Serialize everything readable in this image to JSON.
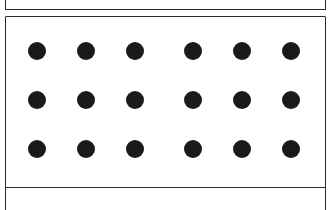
{
  "panels": [
    "top",
    "middle",
    "bottom"
  ],
  "dot_grid": {
    "rows": 3,
    "cols": 6,
    "color": "#1a1a1a",
    "diameter": 18,
    "x_centers": [
      37,
      86,
      135,
      193,
      242,
      291
    ],
    "y_centers": [
      51,
      100,
      149
    ]
  }
}
